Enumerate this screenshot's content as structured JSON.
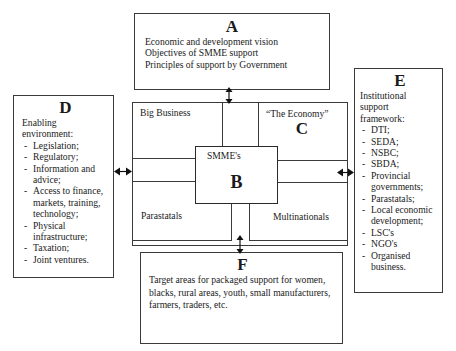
{
  "diagram": {
    "type": "framework",
    "boxes": {
      "A": {
        "letter": "A",
        "lines": [
          "Economic and development vision",
          "Objectives of SMME support",
          "Principles of support by Government"
        ]
      },
      "B": {
        "letter": "B",
        "label": "SMME's"
      },
      "C": {
        "letter": "C",
        "label": "“The Economy”",
        "quadrants": {
          "top_left": "Big Business",
          "bottom_left": "Parastatals",
          "bottom_right": "Multinationals"
        }
      },
      "D": {
        "letter": "D",
        "heading": "Enabling environment:",
        "items": [
          "Legislation;",
          "Regulatory;",
          "Information and advice;",
          "Access to finance, markets, training, technology;",
          "Physical infrastructure;",
          "Taxation;",
          "Joint ventures."
        ]
      },
      "E": {
        "letter": "E",
        "heading": "Institutional support framework:",
        "items": [
          "DTI;",
          "SEDA;",
          "NSBC;",
          "SBDA;",
          "Provincial governments;",
          "Parastatals;",
          "Local economic development;",
          "LSC's",
          "NGO's",
          "Organised business."
        ]
      },
      "F": {
        "letter": "F",
        "text": "Target areas for packaged support for women, blacks, rural areas, youth, small manufacturers, farmers, traders, etc."
      }
    },
    "connections": [
      {
        "from": "A",
        "to": "C",
        "style": "bidirectional-arrow"
      },
      {
        "from": "D",
        "to": "C",
        "style": "bidirectional-arrow"
      },
      {
        "from": "E",
        "to": "C",
        "style": "bidirectional-arrow"
      },
      {
        "from": "C",
        "to": "F",
        "style": "bidirectional-arrow"
      }
    ]
  }
}
